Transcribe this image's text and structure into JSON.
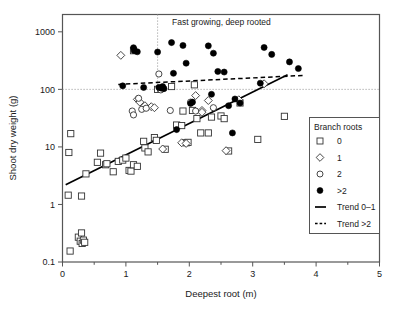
{
  "chart_data": {
    "type": "scatter",
    "title": "",
    "xlabel": "Deepest root (m)",
    "ylabel": "Shoot dry weight (g)",
    "xlim": [
      0,
      5
    ],
    "ylim": [
      0.1,
      2000
    ],
    "yscale": "log",
    "xticks": [
      0,
      1,
      2,
      3,
      4,
      5
    ],
    "xtick_labels": [
      "0",
      "1",
      "2",
      "3",
      "4",
      "5"
    ],
    "xminor_step": 0.5,
    "yticks": [
      0.1,
      1,
      10,
      100,
      1000
    ],
    "ytick_labels": [
      "0.1",
      "1",
      "10",
      "100",
      "1000"
    ],
    "grid": false,
    "legend_position": "right",
    "legend_title": "Branch roots",
    "annotations": [
      {
        "text": "Fast growing, deep rooted",
        "x": 1.58,
        "y": 1250
      }
    ],
    "reference_lines": [
      {
        "name": "vertical-threshold",
        "orientation": "vertical",
        "x": 1.5,
        "y_from": 100,
        "y_to": 2000,
        "style": "dotted"
      },
      {
        "name": "horizontal-threshold",
        "orientation": "horizontal",
        "y": 100,
        "x_from": 0,
        "x_to": 5,
        "style": "dotted"
      }
    ],
    "series": [
      {
        "name": "0",
        "marker": "square-open",
        "points": [
          [
            0.1,
            8.0
          ],
          [
            0.13,
            17.0
          ],
          [
            0.09,
            1.45
          ],
          [
            0.12,
            0.155
          ],
          [
            0.25,
            0.27
          ],
          [
            0.3,
            0.32
          ],
          [
            0.28,
            0.23
          ],
          [
            0.31,
            0.21
          ],
          [
            0.33,
            0.24
          ],
          [
            0.35,
            0.22
          ],
          [
            0.3,
            1.4
          ],
          [
            0.37,
            3.4
          ],
          [
            0.55,
            5.4
          ],
          [
            0.6,
            7.8
          ],
          [
            0.68,
            4.9
          ],
          [
            0.7,
            5.1
          ],
          [
            0.8,
            3.7
          ],
          [
            0.88,
            5.6
          ],
          [
            0.95,
            5.9
          ],
          [
            1.0,
            6.4
          ],
          [
            1.05,
            3.9
          ],
          [
            1.08,
            3.8
          ],
          [
            1.12,
            4.9
          ],
          [
            1.18,
            4.6
          ],
          [
            1.12,
            470
          ],
          [
            1.28,
            12.5
          ],
          [
            1.3,
            9.6
          ],
          [
            1.35,
            8.2
          ],
          [
            1.45,
            14.5
          ],
          [
            1.48,
            13.0
          ],
          [
            1.5,
            100
          ],
          [
            1.55,
            105
          ],
          [
            1.62,
            9.1
          ],
          [
            1.72,
            112
          ],
          [
            1.8,
            24.0
          ],
          [
            1.88,
            23.5
          ],
          [
            1.9,
            42.0
          ],
          [
            1.95,
            11.8
          ],
          [
            1.98,
            12.0
          ],
          [
            2.05,
            43.0
          ],
          [
            2.08,
            120
          ],
          [
            2.12,
            31.0
          ],
          [
            2.18,
            17.5
          ],
          [
            2.3,
            17.5
          ],
          [
            2.35,
            33.0
          ],
          [
            2.5,
            34.5
          ],
          [
            2.55,
            31.0
          ],
          [
            2.62,
            8.5
          ],
          [
            2.8,
            58.0
          ],
          [
            3.08,
            13.5
          ],
          [
            3.5,
            34.0
          ]
        ]
      },
      {
        "name": "1",
        "marker": "diamond-open",
        "points": [
          [
            0.92,
            390
          ],
          [
            1.18,
            67.0
          ],
          [
            1.22,
            60.0
          ],
          [
            1.3,
            52.0
          ],
          [
            1.4,
            50.0
          ],
          [
            1.45,
            48.0
          ],
          [
            1.58,
            9.2
          ],
          [
            1.88,
            11.8
          ],
          [
            1.95,
            11.5
          ],
          [
            2.1,
            78.0
          ],
          [
            2.2,
            43.0
          ],
          [
            2.3,
            64.0
          ],
          [
            2.2,
            40.0
          ],
          [
            2.58,
            8.6
          ],
          [
            2.78,
            66.0
          ],
          [
            3.18,
            125
          ]
        ]
      },
      {
        "name": "2",
        "marker": "circle-open",
        "points": [
          [
            1.1,
            42.0
          ],
          [
            1.12,
            36.0
          ],
          [
            1.2,
            70.0
          ],
          [
            1.25,
            45.0
          ],
          [
            1.32,
            47.0
          ],
          [
            1.52,
            185
          ],
          [
            1.55,
            98.0
          ],
          [
            1.7,
            43.0
          ],
          [
            2.02,
            60.0
          ],
          [
            2.1,
            42.0
          ],
          [
            2.38,
            48.0
          ]
        ]
      },
      {
        "name": ">2",
        "marker": "circle-filled",
        "points": [
          [
            0.95,
            115
          ],
          [
            1.12,
            530
          ],
          [
            1.13,
            470
          ],
          [
            1.18,
            450
          ],
          [
            1.28,
            108
          ],
          [
            1.5,
            445
          ],
          [
            1.52,
            108
          ],
          [
            1.56,
            105
          ],
          [
            1.58,
            112
          ],
          [
            1.6,
            103
          ],
          [
            1.72,
            650
          ],
          [
            1.75,
            190
          ],
          [
            1.8,
            20.0
          ],
          [
            1.9,
            580
          ],
          [
            1.95,
            285
          ],
          [
            2.02,
            57.0
          ],
          [
            2.05,
            60.0
          ],
          [
            2.3,
            570
          ],
          [
            2.35,
            82.0
          ],
          [
            2.38,
            425
          ],
          [
            2.45,
            205
          ],
          [
            2.55,
            200
          ],
          [
            2.62,
            52.0
          ],
          [
            2.68,
            17.5
          ],
          [
            2.72,
            68.0
          ],
          [
            2.8,
            58.0
          ],
          [
            3.12,
            128
          ],
          [
            3.18,
            535
          ],
          [
            3.3,
            405
          ],
          [
            3.58,
            300
          ],
          [
            3.72,
            230
          ]
        ]
      }
    ],
    "trend_lines": [
      {
        "name": "Trend 0–1",
        "style": "solid",
        "x_from": 0.05,
        "y_from": 2.2,
        "x_to": 3.55,
        "y_to": 180
      },
      {
        "name": "Trend >2",
        "style": "dashed",
        "x_from": 0.88,
        "y_from": 122,
        "x_to": 3.82,
        "y_to": 175
      }
    ],
    "legend_entries": [
      {
        "label": "0",
        "marker": "square-open"
      },
      {
        "label": "1",
        "marker": "diamond-open"
      },
      {
        "label": "2",
        "marker": "circle-open"
      },
      {
        "label": ">2",
        "marker": "circle-filled"
      },
      {
        "label": "Trend 0–1",
        "marker": "line-solid"
      },
      {
        "label": "Trend >2",
        "marker": "line-dashed"
      }
    ]
  },
  "colors": {
    "ink": "#1a1a1a",
    "frame": "#555555",
    "marker_stroke": "#333333",
    "marker_fill_open": "#ffffff",
    "marker_fill_solid": "#000000",
    "reference": "#999999"
  }
}
